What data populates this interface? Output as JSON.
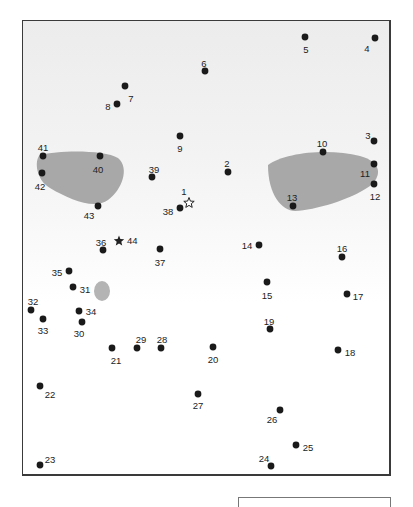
{
  "puzzle": {
    "type": "connect-the-dots",
    "start_marker": {
      "label": "1",
      "shape": "outline-star",
      "x": 189,
      "y": 203
    },
    "end_marker": {
      "label": "44",
      "shape": "filled-star",
      "x": 119,
      "y": 241
    },
    "dots": [
      {
        "n": "2",
        "x": 228,
        "y": 172,
        "lx": 227,
        "ly": 164
      },
      {
        "n": "3",
        "x": 374,
        "y": 141,
        "lx": 368,
        "ly": 136
      },
      {
        "n": "4",
        "x": 375,
        "y": 38,
        "lx": 367,
        "ly": 49
      },
      {
        "n": "5",
        "x": 305,
        "y": 37,
        "lx": 306,
        "ly": 50
      },
      {
        "n": "6",
        "x": 205,
        "y": 71,
        "lx": 204,
        "ly": 64
      },
      {
        "n": "7",
        "x": 125,
        "y": 86,
        "lx": 131,
        "ly": 99
      },
      {
        "n": "8",
        "x": 117,
        "y": 104,
        "lx": 108,
        "ly": 107
      },
      {
        "n": "9",
        "x": 180,
        "y": 136,
        "lx": 180,
        "ly": 149
      },
      {
        "n": "10",
        "x": 323,
        "y": 152,
        "lx": 322,
        "ly": 144
      },
      {
        "n": "11",
        "x": 374,
        "y": 164,
        "lx": 365,
        "ly": 174
      },
      {
        "n": "12",
        "x": 374,
        "y": 184,
        "lx": 375,
        "ly": 197
      },
      {
        "n": "13",
        "x": 293,
        "y": 206,
        "lx": 292,
        "ly": 198
      },
      {
        "n": "14",
        "x": 259,
        "y": 245,
        "lx": 247,
        "ly": 246
      },
      {
        "n": "15",
        "x": 267,
        "y": 282,
        "lx": 267,
        "ly": 296
      },
      {
        "n": "16",
        "x": 342,
        "y": 257,
        "lx": 342,
        "ly": 249
      },
      {
        "n": "17",
        "x": 347,
        "y": 294,
        "lx": 358,
        "ly": 297
      },
      {
        "n": "18",
        "x": 338,
        "y": 350,
        "lx": 350,
        "ly": 353
      },
      {
        "n": "19",
        "x": 270,
        "y": 329,
        "lx": 269,
        "ly": 322
      },
      {
        "n": "20",
        "x": 213,
        "y": 347,
        "lx": 213,
        "ly": 360
      },
      {
        "n": "21",
        "x": 112,
        "y": 348,
        "lx": 116,
        "ly": 361
      },
      {
        "n": "22",
        "x": 40,
        "y": 386,
        "lx": 50,
        "ly": 395
      },
      {
        "n": "23",
        "x": 40,
        "y": 465,
        "lx": 50,
        "ly": 460
      },
      {
        "n": "24",
        "x": 271,
        "y": 466,
        "lx": 264,
        "ly": 459
      },
      {
        "n": "25",
        "x": 296,
        "y": 445,
        "lx": 308,
        "ly": 448
      },
      {
        "n": "26",
        "x": 280,
        "y": 410,
        "lx": 272,
        "ly": 420
      },
      {
        "n": "27",
        "x": 198,
        "y": 394,
        "lx": 198,
        "ly": 406
      },
      {
        "n": "28",
        "x": 161,
        "y": 348,
        "lx": 162,
        "ly": 340
      },
      {
        "n": "29",
        "x": 137,
        "y": 348,
        "lx": 141,
        "ly": 340
      },
      {
        "n": "30",
        "x": 82,
        "y": 322,
        "lx": 79,
        "ly": 334
      },
      {
        "n": "31",
        "x": 73,
        "y": 287,
        "lx": 85,
        "ly": 290
      },
      {
        "n": "32",
        "x": 31,
        "y": 310,
        "lx": 33,
        "ly": 302
      },
      {
        "n": "33",
        "x": 43,
        "y": 319,
        "lx": 43,
        "ly": 331
      },
      {
        "n": "34",
        "x": 79,
        "y": 311,
        "lx": 91,
        "ly": 312
      },
      {
        "n": "35",
        "x": 69,
        "y": 271,
        "lx": 57,
        "ly": 273
      },
      {
        "n": "36",
        "x": 103,
        "y": 250,
        "lx": 101,
        "ly": 243
      },
      {
        "n": "37",
        "x": 160,
        "y": 249,
        "lx": 160,
        "ly": 263
      },
      {
        "n": "38",
        "x": 180,
        "y": 208,
        "lx": 168,
        "ly": 212
      },
      {
        "n": "39",
        "x": 152,
        "y": 177,
        "lx": 154,
        "ly": 170
      },
      {
        "n": "40",
        "x": 100,
        "y": 156,
        "lx": 98,
        "ly": 170
      },
      {
        "n": "41",
        "x": 43,
        "y": 156,
        "lx": 43,
        "ly": 148
      },
      {
        "n": "42",
        "x": 42,
        "y": 173,
        "lx": 40,
        "ly": 187
      },
      {
        "n": "43",
        "x": 98,
        "y": 206,
        "lx": 89,
        "ly": 216
      }
    ],
    "shapes": [
      {
        "name": "left-eye-shape",
        "color": "#a8a8a8"
      },
      {
        "name": "right-eye-shape",
        "color": "#a8a8a8"
      },
      {
        "name": "small-oval",
        "color": "#b4b4b4"
      }
    ],
    "dot_color": "#1a1a1a"
  }
}
